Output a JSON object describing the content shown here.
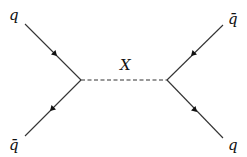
{
  "diagram": {
    "type": "feynman",
    "title": "",
    "particles": {
      "top_left": "q",
      "bottom_left": "q̄",
      "top_right": "q̄",
      "bottom_right": "q",
      "mediator": "X"
    },
    "vertices": [
      {
        "id": "left",
        "x": 81,
        "y": 80
      },
      {
        "id": "right",
        "x": 167,
        "y": 80
      }
    ],
    "edges": [
      {
        "from": "top_left",
        "to": "left",
        "style": "solid",
        "arrow": "toward-vertex",
        "label": "q"
      },
      {
        "from": "left",
        "to": "bottom_left",
        "style": "solid",
        "arrow": "away-from-vertex",
        "label": "q̄"
      },
      {
        "from": "left",
        "to": "right",
        "style": "dashed",
        "arrow": "none",
        "label": "X"
      },
      {
        "from": "top_right",
        "to": "right",
        "style": "solid",
        "arrow": "toward-vertex",
        "label": "q̄"
      },
      {
        "from": "right",
        "to": "bottom_right",
        "style": "solid",
        "arrow": "away-from-vertex",
        "label": "q"
      }
    ]
  }
}
